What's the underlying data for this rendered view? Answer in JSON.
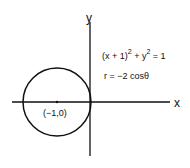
{
  "diagram": {
    "axes": {
      "x_label": "x",
      "y_label": "y"
    },
    "circle": {
      "center_label": "(−1,0)",
      "center": [
        -1,
        0
      ],
      "radius": 1
    },
    "equations": {
      "cartesian_base": "(x + 1)",
      "cartesian_exp1": "2",
      "cartesian_mid": " + y",
      "cartesian_exp2": "2",
      "cartesian_end": " = 1",
      "polar": "r = −2 cosθ"
    },
    "colors": {
      "stroke": "#111111",
      "background": "#ffffff"
    }
  }
}
